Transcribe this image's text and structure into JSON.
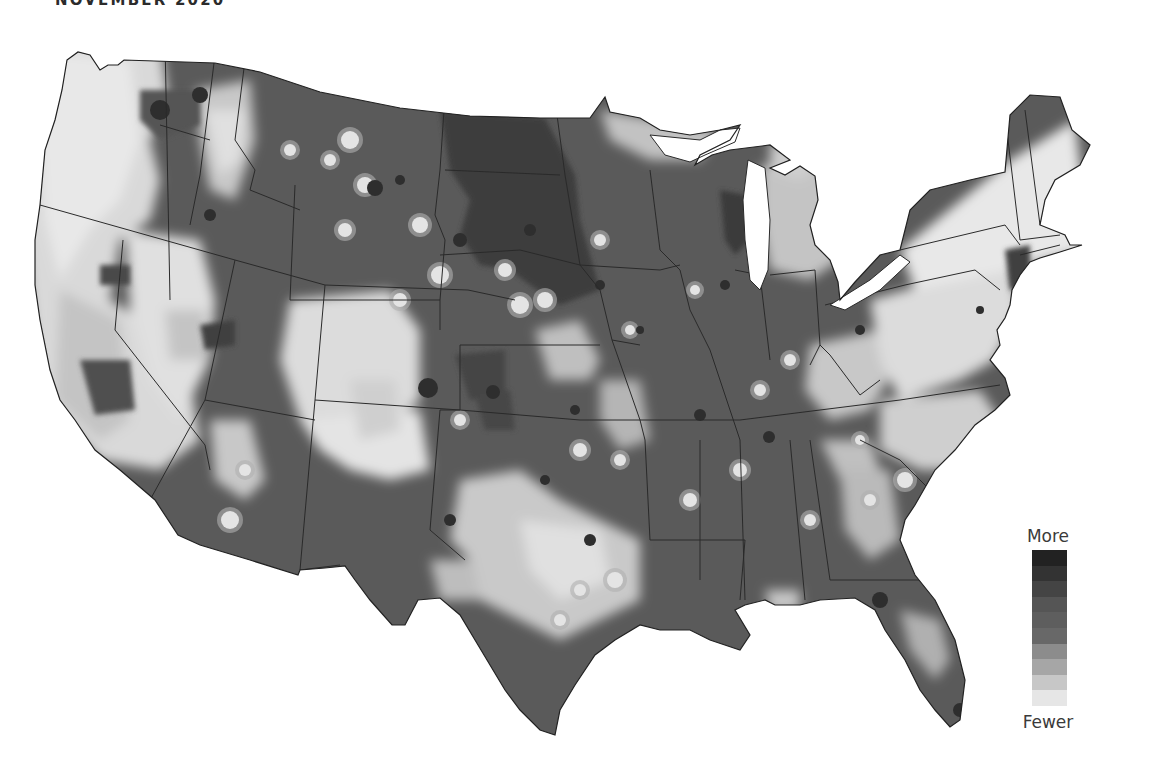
{
  "header": {
    "title": "NOVEMBER 2020"
  },
  "legend": {
    "high_label": "More",
    "low_label": "Fewer",
    "steps": [
      "#222222",
      "#333333",
      "#444444",
      "#555555",
      "#5e5e5e",
      "#686868",
      "#8c8c8c",
      "#a6a6a6",
      "#c7c7c7",
      "#e6e6e6"
    ]
  },
  "colors": {
    "base": "#5a5a5a",
    "land_light": "#e8e8e8",
    "land_mid": "#c6c6c6",
    "land_midlow": "#a4a4a4",
    "dark": "#3e3e3e",
    "darkest": "#262626",
    "border": "#2a2a2a",
    "water": "#ffffff"
  },
  "regions": {
    "light": [
      [
        100,
        230,
        140,
        140
      ],
      [
        60,
        300,
        110,
        120
      ],
      [
        130,
        130,
        90,
        70
      ],
      [
        60,
        430,
        60,
        60
      ],
      [
        120,
        330,
        80,
        100
      ],
      [
        340,
        220,
        90,
        70
      ],
      [
        350,
        300,
        130,
        160
      ],
      [
        280,
        330,
        120,
        160
      ],
      [
        450,
        490,
        90,
        80
      ],
      [
        550,
        520,
        130,
        140
      ],
      [
        500,
        600,
        60,
        60
      ],
      [
        620,
        470,
        60,
        80
      ],
      [
        880,
        440,
        110,
        40
      ],
      [
        930,
        290,
        150,
        90
      ],
      [
        850,
        260,
        240,
        80
      ],
      [
        860,
        330,
        90,
        60
      ],
      [
        970,
        120,
        110,
        220
      ],
      [
        750,
        170,
        60,
        120
      ],
      [
        820,
        340,
        140,
        60
      ],
      [
        840,
        380,
        110,
        50
      ],
      [
        600,
        330,
        70,
        50
      ],
      [
        540,
        380,
        60,
        60
      ],
      [
        590,
        420,
        40,
        60
      ],
      [
        770,
        230,
        60,
        60
      ],
      [
        730,
        70,
        70,
        50
      ],
      [
        950,
        600,
        40,
        60
      ],
      [
        760,
        590,
        30,
        30
      ],
      [
        185,
        110,
        40,
        40
      ],
      [
        240,
        180,
        50,
        60
      ],
      [
        320,
        240,
        60,
        60
      ],
      [
        290,
        440,
        80,
        60
      ],
      [
        230,
        480,
        50,
        80
      ],
      [
        875,
        500,
        50,
        60
      ]
    ],
    "dark": [
      [
        470,
        110,
        120,
        110
      ],
      [
        480,
        220,
        110,
        60
      ],
      [
        560,
        260,
        60,
        60
      ],
      [
        720,
        200,
        30,
        60
      ],
      [
        460,
        360,
        40,
        40
      ],
      [
        480,
        400,
        30,
        40
      ],
      [
        430,
        390,
        25,
        25
      ],
      [
        280,
        320,
        30,
        30
      ],
      [
        80,
        370,
        50,
        50
      ],
      [
        100,
        270,
        40,
        30
      ],
      [
        90,
        70,
        60,
        50
      ],
      [
        210,
        330,
        30,
        30
      ],
      [
        370,
        185,
        30,
        20
      ],
      [
        1010,
        260,
        20,
        30
      ]
    ],
    "dots_light": [
      [
        350,
        140,
        9
      ],
      [
        365,
        185,
        8
      ],
      [
        330,
        160,
        6
      ],
      [
        290,
        150,
        6
      ],
      [
        345,
        230,
        7
      ],
      [
        420,
        225,
        8
      ],
      [
        440,
        275,
        9
      ],
      [
        505,
        270,
        7
      ],
      [
        400,
        300,
        7
      ],
      [
        520,
        305,
        9
      ],
      [
        545,
        300,
        8
      ],
      [
        600,
        240,
        6
      ],
      [
        695,
        290,
        5
      ],
      [
        760,
        390,
        6
      ],
      [
        790,
        360,
        6
      ],
      [
        870,
        500,
        6
      ],
      [
        905,
        480,
        8
      ],
      [
        690,
        500,
        7
      ],
      [
        620,
        460,
        6
      ],
      [
        580,
        450,
        7
      ],
      [
        740,
        470,
        7
      ],
      [
        810,
        520,
        6
      ],
      [
        860,
        440,
        5
      ],
      [
        230,
        520,
        9
      ],
      [
        245,
        470,
        6
      ],
      [
        630,
        330,
        5
      ],
      [
        580,
        590,
        6
      ],
      [
        560,
        620,
        6
      ],
      [
        615,
        580,
        8
      ],
      [
        460,
        420,
        6
      ]
    ],
    "dots_dark": [
      [
        375,
        188,
        8
      ],
      [
        428,
        388,
        10
      ],
      [
        400,
        180,
        5
      ],
      [
        530,
        230,
        6
      ],
      [
        460,
        240,
        7
      ],
      [
        769,
        437,
        6
      ],
      [
        880,
        600,
        8
      ],
      [
        960,
        710,
        7
      ],
      [
        493,
        392,
        7
      ],
      [
        210,
        215,
        6
      ],
      [
        160,
        110,
        10
      ],
      [
        200,
        95,
        8
      ],
      [
        340,
        580,
        6
      ],
      [
        450,
        520,
        6
      ],
      [
        590,
        540,
        6
      ],
      [
        545,
        480,
        5
      ],
      [
        640,
        330,
        4
      ],
      [
        860,
        330,
        5
      ],
      [
        980,
        310,
        4
      ],
      [
        725,
        285,
        5
      ],
      [
        600,
        285,
        5
      ],
      [
        575,
        410,
        5
      ],
      [
        700,
        415,
        6
      ]
    ]
  },
  "state_borders": [
    "M165,40 L170,300",
    "M40,205 L235,260 L325,285 L468,290 L515,300",
    "M160,125 L210,140",
    "M215,55 L200,175 L190,225",
    "M245,60 L235,140 L255,170 L250,190 L300,210",
    "M295,185 L290,300 L440,300 L440,330",
    "M325,285 L315,400 L460,410",
    "M235,260 L205,400 L315,420",
    "M123,240 L115,330 L205,445 L210,470",
    "M205,400 L150,500",
    "M315,400 L300,570 L340,565",
    "M460,410 L440,410 L430,530 L465,560",
    "M440,300 L445,240 L435,215 L440,170 L445,95",
    "M555,100 L565,175 L580,265",
    "M440,255 L520,250 L580,265",
    "M445,170 L560,175",
    "M580,265 L600,290 L612,340 L640,345",
    "M580,265 L660,270 L680,265",
    "M600,345 L460,345",
    "M460,345 L460,410",
    "M460,410 L580,420 L640,420",
    "M612,340 L640,420 L645,440 L650,540",
    "M650,170 L660,250 L680,270",
    "M680,270 L690,310 L710,350 L730,410 L740,440",
    "M735,270 L760,275 L770,360",
    "M770,275 L815,270 L820,345 L810,365",
    "M640,420 L740,420 L900,400 L1000,385",
    "M650,540 L745,540 L740,600",
    "M700,440 L700,580",
    "M740,440 L745,600",
    "M790,440 L805,600",
    "M810,440 L830,580 L930,580",
    "M860,440 L900,460 L930,490 L950,480",
    "M820,345 L830,355 L860,395 L880,380",
    "M825,305 L905,285 L975,270 L1000,290",
    "M900,250 L1005,225 L1020,245",
    "M1005,115 L1020,240",
    "M1020,240 L1060,235",
    "M1025,110 L1040,225",
    "M1020,255 L1060,245"
  ]
}
